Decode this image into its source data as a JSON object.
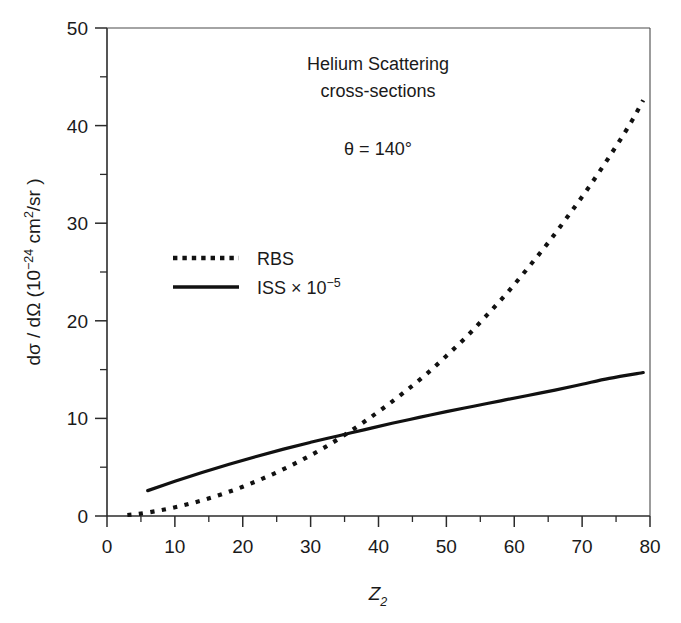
{
  "chart_data": {
    "type": "line",
    "title": "Helium Scattering cross-sections",
    "title_line1": "Helium Scattering",
    "title_line2": "cross-sections",
    "annotation": "θ = 140°",
    "xlabel": "Z₂",
    "xlabel_base": "Z",
    "xlabel_sub": "2",
    "ylabel": "dσ / dΩ (10⁻²⁴ cm²/sr)",
    "ylabel_parts": {
      "lead": "dσ / dΩ (10",
      "exp1": "−24",
      "mid": " cm",
      "exp2": "2",
      "tail": "/sr )"
    },
    "xlim": [
      0,
      80
    ],
    "ylim": [
      0,
      50
    ],
    "xticks": [
      0,
      10,
      20,
      30,
      40,
      50,
      60,
      70,
      80
    ],
    "yticks": [
      0,
      10,
      20,
      30,
      40,
      50
    ],
    "x_minor_ticks": [
      5,
      15,
      25,
      35,
      45,
      55,
      65,
      75
    ],
    "y_minor_ticks": [
      5,
      15,
      25,
      35,
      45
    ],
    "grid": false,
    "legend_position": "upper-left-inside",
    "series": [
      {
        "name": "RBS",
        "label": "RBS",
        "style": "dotted",
        "color": "#111111",
        "x": [
          3,
          5,
          8,
          11,
          14,
          17,
          20,
          23,
          26,
          29,
          32,
          35,
          38,
          41,
          44,
          47,
          50,
          53,
          56,
          59,
          62,
          65,
          68,
          71,
          74,
          77,
          79
        ],
        "y": [
          0.1,
          0.25,
          0.6,
          1.05,
          1.6,
          2.25,
          3.0,
          3.85,
          4.8,
          5.85,
          7.0,
          8.3,
          9.7,
          11.2,
          12.8,
          14.5,
          16.4,
          18.4,
          20.6,
          22.9,
          25.4,
          28.0,
          30.8,
          33.7,
          36.8,
          40.1,
          42.6
        ]
      },
      {
        "name": "ISS",
        "label": "ISS × 10⁻⁵",
        "label_base": "ISS × 10",
        "label_exp": "−5",
        "style": "solid",
        "color": "#111111",
        "x": [
          6,
          10,
          14,
          18,
          22,
          26,
          30,
          34,
          38,
          42,
          46,
          50,
          54,
          58,
          62,
          66,
          70,
          74,
          79
        ],
        "y": [
          2.6,
          3.55,
          4.45,
          5.3,
          6.1,
          6.85,
          7.55,
          8.2,
          8.85,
          9.5,
          10.1,
          10.7,
          11.25,
          11.8,
          12.35,
          12.9,
          13.5,
          14.1,
          14.7
        ]
      }
    ],
    "legend_entries": [
      {
        "label": "RBS",
        "style": "dotted"
      },
      {
        "label": "ISS × 10⁻⁵",
        "style": "solid"
      }
    ]
  }
}
